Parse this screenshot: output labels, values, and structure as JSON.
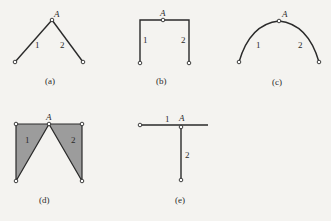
{
  "figures": [
    {
      "id": "a",
      "caption": "(a)",
      "joint_label": "A",
      "member_labels": [
        "1",
        "2"
      ],
      "description": "Two straight bars hinged at apex A, forming an inverted V"
    },
    {
      "id": "b",
      "caption": "(b)",
      "joint_label": "A",
      "member_labels": [
        "1",
        "2"
      ],
      "description": "Two L-shaped bars hinged at A at mid-top, forming a portal frame"
    },
    {
      "id": "c",
      "caption": "(c)",
      "joint_label": "A",
      "member_labels": [
        "1",
        "2"
      ],
      "description": "Two curved bars hinged at crown A, forming a three-hinged arch"
    },
    {
      "id": "d",
      "caption": "(d)",
      "joint_label": "A",
      "member_labels": [
        "1",
        "2"
      ],
      "description": "Two shaded triangular plates hinged at A"
    },
    {
      "id": "e",
      "caption": "(e)",
      "joint_label": "A",
      "member_labels": [
        "1",
        "2"
      ],
      "description": "Horizontal bar 1 and vertical bar 2 hinged at A forming a T"
    }
  ],
  "colors": {
    "background": "#f4f3f0",
    "line": "#2a2a2a",
    "plate_fill": "#9c9c9c",
    "node_fill": "#ffffff"
  }
}
